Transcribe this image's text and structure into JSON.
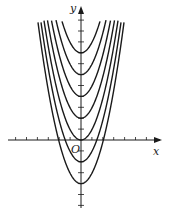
{
  "chart_data": {
    "type": "line",
    "title": "",
    "xlabel": "x",
    "ylabel": "y",
    "origin_label": "O",
    "function_family": "y = x^2 + c",
    "series": [
      {
        "name": "c=8",
        "c": 8
      },
      {
        "name": "c=6",
        "c": 6
      },
      {
        "name": "c=4",
        "c": 4
      },
      {
        "name": "c=2",
        "c": 2
      },
      {
        "name": "c=0",
        "c": 0
      },
      {
        "name": "c=-2",
        "c": -2
      },
      {
        "name": "c=-4",
        "c": -4
      }
    ],
    "xlim": [
      -7,
      7.5
    ],
    "ylim": [
      -5.5,
      12
    ],
    "grid": false,
    "legend": "none"
  },
  "colors": {
    "curve": "#1a1a1a",
    "axis": "#1a1a1a",
    "background": "#ffffff"
  }
}
